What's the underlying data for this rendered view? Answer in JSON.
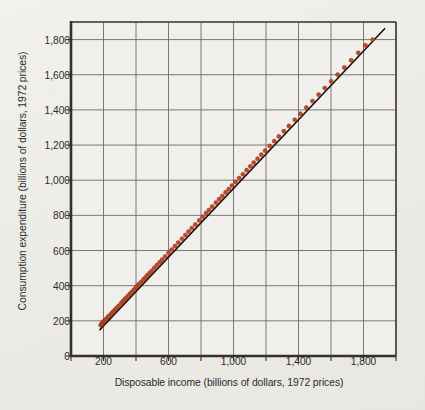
{
  "figure": {
    "background_color": "#efeeea",
    "plot_background_color": "#f0efeb",
    "axis_color": "#35302c",
    "grid_color": "#6f6a66",
    "marker_color": "#c0492b",
    "marker_edge_color": "#8e3219",
    "line_color": "#17120f"
  },
  "chart_data": {
    "type": "scatter",
    "title": "",
    "xlabel": "Disposable income (billions of dollars, 1972 prices)",
    "ylabel": "Consumption expenditure (billions of dollars, 1972 prices)",
    "xlim": [
      0,
      2000
    ],
    "ylim": [
      0,
      1900
    ],
    "grid": true,
    "legend": null,
    "xticks": [
      0,
      200,
      400,
      600,
      800,
      1000,
      1200,
      1400,
      1600,
      1800,
      2000
    ],
    "xticklabels": [
      "0",
      "200",
      "",
      "600",
      "",
      "1,000",
      "",
      "1,400",
      "",
      "1,800",
      ""
    ],
    "yticks": [
      0,
      200,
      400,
      600,
      800,
      1000,
      1200,
      1400,
      1600,
      1800
    ],
    "yticklabels": [
      "0",
      "200",
      "400",
      "600",
      "800",
      "1,000",
      "1,200",
      "1,400",
      "1,600",
      "1,800"
    ],
    "origin_label": "0",
    "series": [
      {
        "name": "Consumption vs. disposable income",
        "marker": "circle",
        "x": [
          183,
          188,
          190,
          193,
          196,
          199,
          201,
          205,
          208,
          214,
          219,
          229,
          236,
          246,
          255,
          264,
          274,
          281,
          293,
          309,
          318,
          323,
          332,
          340,
          351,
          364,
          373,
          386,
          399,
          404,
          412,
          420,
          433,
          447,
          459,
          470,
          483,
          497,
          513,
          529,
          546,
          561,
          580,
          601,
          620,
          640,
          660,
          683,
          704,
          724,
          744,
          765,
          789,
          810,
          831,
          849,
          869,
          892,
          912,
          931,
          952,
          971,
          991,
          1013,
          1035,
          1058,
          1081,
          1104,
          1125,
          1148,
          1171,
          1195,
          1223,
          1251,
          1279,
          1310,
          1341,
          1377,
          1412,
          1448,
          1486,
          1524,
          1562,
          1601,
          1641,
          1682,
          1724,
          1768,
          1812,
          1857
        ],
        "y": [
          175,
          181,
          183,
          186,
          190,
          192,
          195,
          199,
          202,
          207,
          213,
          223,
          229,
          239,
          248,
          256,
          266,
          273,
          285,
          300,
          309,
          314,
          323,
          331,
          342,
          354,
          363,
          376,
          389,
          394,
          402,
          410,
          422,
          436,
          448,
          459,
          471,
          485,
          501,
          517,
          533,
          548,
          566,
          587,
          605,
          625,
          645,
          667,
          688,
          708,
          727,
          748,
          771,
          792,
          813,
          830,
          850,
          872,
          892,
          910,
          931,
          949,
          969,
          990,
          1012,
          1034,
          1057,
          1079,
          1100,
          1122,
          1145,
          1168,
          1195,
          1222,
          1249,
          1279,
          1309,
          1344,
          1378,
          1413,
          1450,
          1487,
          1524,
          1562,
          1601,
          1641,
          1682,
          1724,
          1767,
          1800
        ]
      }
    ],
    "fit_line": {
      "name": "fitted regression line",
      "x_start": 178,
      "y_start": 150,
      "x_end": 1930,
      "y_end": 1862
    }
  }
}
